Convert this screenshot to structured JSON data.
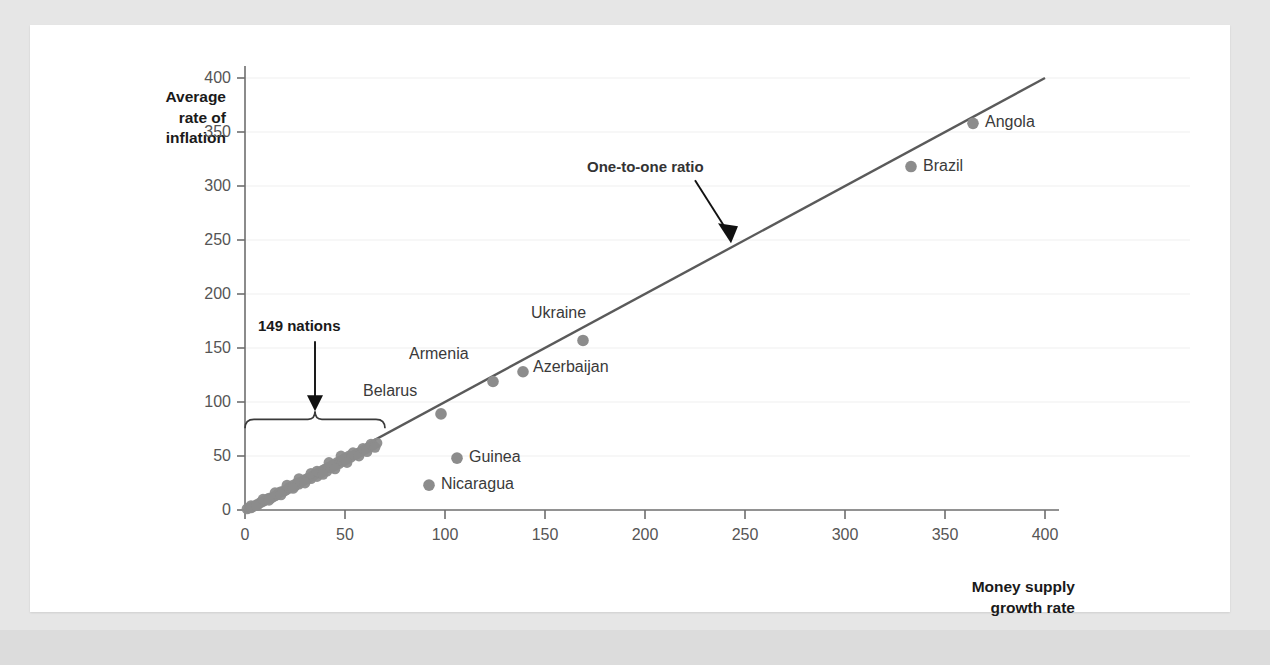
{
  "figure": {
    "background_color": "#e6e6e6",
    "card_color": "#ffffff"
  },
  "chart_data": {
    "type": "scatter",
    "title": "",
    "xlabel": "Money supply\ngrowth rate",
    "ylabel": "Average\nrate of\ninflation",
    "xlim": [
      0,
      400
    ],
    "ylim": [
      0,
      400
    ],
    "xticks": [
      0,
      50,
      100,
      150,
      200,
      250,
      300,
      350,
      400
    ],
    "yticks": [
      0,
      50,
      100,
      150,
      200,
      250,
      300,
      350,
      400
    ],
    "grid": "horizontal-light",
    "legend": "none",
    "point_color": "#8c8c8c",
    "line_color": "#5a5a5a",
    "reference_line": {
      "label": "One-to-one ratio",
      "slope": 1,
      "intercept": 0,
      "from": [
        0,
        0
      ],
      "to": [
        400,
        400
      ]
    },
    "labeled_points": [
      {
        "name": "Belarus",
        "x": 98,
        "y": 89,
        "label_dx": -78,
        "label_dy": -22
      },
      {
        "name": "Armenia",
        "x": 124,
        "y": 119,
        "label_dx": -84,
        "label_dy": -26
      },
      {
        "name": "Azerbaijan",
        "x": 139,
        "y": 128,
        "label_dx": 10,
        "label_dy": -4
      },
      {
        "name": "Ukraine",
        "x": 169,
        "y": 157,
        "label_dx": -52,
        "label_dy": -26
      },
      {
        "name": "Brazil",
        "x": 333,
        "y": 318,
        "label_dx": 12,
        "label_dy": 0
      },
      {
        "name": "Angola",
        "x": 364,
        "y": 358,
        "label_dx": 12,
        "label_dy": 0
      },
      {
        "name": "Guinea",
        "x": 106,
        "y": 48,
        "label_dx": 12,
        "label_dy": 0
      },
      {
        "name": "Nicaragua",
        "x": 92,
        "y": 23,
        "label_dx": 12,
        "label_dy": 0
      }
    ],
    "cluster_points": [
      {
        "x": 1,
        "y": 1
      },
      {
        "x": 2,
        "y": 2
      },
      {
        "x": 3,
        "y": 2
      },
      {
        "x": 4,
        "y": 3
      },
      {
        "x": 5,
        "y": 4
      },
      {
        "x": 6,
        "y": 5
      },
      {
        "x": 7,
        "y": 6
      },
      {
        "x": 8,
        "y": 7
      },
      {
        "x": 9,
        "y": 8
      },
      {
        "x": 10,
        "y": 9
      },
      {
        "x": 11,
        "y": 10
      },
      {
        "x": 12,
        "y": 11
      },
      {
        "x": 13,
        "y": 11
      },
      {
        "x": 14,
        "y": 12
      },
      {
        "x": 15,
        "y": 13
      },
      {
        "x": 16,
        "y": 14
      },
      {
        "x": 17,
        "y": 16
      },
      {
        "x": 18,
        "y": 17
      },
      {
        "x": 19,
        "y": 17
      },
      {
        "x": 20,
        "y": 18
      },
      {
        "x": 21,
        "y": 19
      },
      {
        "x": 22,
        "y": 21
      },
      {
        "x": 23,
        "y": 21
      },
      {
        "x": 24,
        "y": 23
      },
      {
        "x": 25,
        "y": 22
      },
      {
        "x": 26,
        "y": 25
      },
      {
        "x": 27,
        "y": 24
      },
      {
        "x": 28,
        "y": 26
      },
      {
        "x": 29,
        "y": 27
      },
      {
        "x": 30,
        "y": 28
      },
      {
        "x": 31,
        "y": 29
      },
      {
        "x": 32,
        "y": 30
      },
      {
        "x": 33,
        "y": 29
      },
      {
        "x": 34,
        "y": 32
      },
      {
        "x": 35,
        "y": 33
      },
      {
        "x": 36,
        "y": 31
      },
      {
        "x": 37,
        "y": 35
      },
      {
        "x": 38,
        "y": 34
      },
      {
        "x": 39,
        "y": 37
      },
      {
        "x": 40,
        "y": 38
      },
      {
        "x": 41,
        "y": 36
      },
      {
        "x": 42,
        "y": 40
      },
      {
        "x": 43,
        "y": 39
      },
      {
        "x": 44,
        "y": 42
      },
      {
        "x": 45,
        "y": 41
      },
      {
        "x": 46,
        "y": 44
      },
      {
        "x": 47,
        "y": 43
      },
      {
        "x": 48,
        "y": 46
      },
      {
        "x": 49,
        "y": 45
      },
      {
        "x": 50,
        "y": 48
      },
      {
        "x": 51,
        "y": 47
      },
      {
        "x": 52,
        "y": 50
      },
      {
        "x": 53,
        "y": 49
      },
      {
        "x": 55,
        "y": 51
      },
      {
        "x": 56,
        "y": 52
      },
      {
        "x": 58,
        "y": 54
      },
      {
        "x": 60,
        "y": 56
      },
      {
        "x": 62,
        "y": 58
      },
      {
        "x": 64,
        "y": 60
      },
      {
        "x": 66,
        "y": 62
      },
      {
        "x": 3,
        "y": 4
      },
      {
        "x": 6,
        "y": 4
      },
      {
        "x": 9,
        "y": 10
      },
      {
        "x": 12,
        "y": 9
      },
      {
        "x": 15,
        "y": 16
      },
      {
        "x": 18,
        "y": 14
      },
      {
        "x": 21,
        "y": 23
      },
      {
        "x": 24,
        "y": 20
      },
      {
        "x": 27,
        "y": 29
      },
      {
        "x": 30,
        "y": 25
      },
      {
        "x": 33,
        "y": 34
      },
      {
        "x": 36,
        "y": 36
      },
      {
        "x": 39,
        "y": 33
      },
      {
        "x": 42,
        "y": 44
      },
      {
        "x": 45,
        "y": 38
      },
      {
        "x": 48,
        "y": 50
      },
      {
        "x": 51,
        "y": 44
      },
      {
        "x": 54,
        "y": 53
      },
      {
        "x": 57,
        "y": 50
      },
      {
        "x": 59,
        "y": 57
      },
      {
        "x": 61,
        "y": 54
      },
      {
        "x": 63,
        "y": 61
      },
      {
        "x": 65,
        "y": 58
      }
    ],
    "annotations": [
      {
        "id": "nations-bracket",
        "text": "149 nations",
        "bracket_from_x": 0,
        "bracket_to_x": 70,
        "bracket_y": 84
      },
      {
        "id": "one-to-one",
        "text": "One-to-one ratio",
        "arrow_tip_x": 245,
        "arrow_tip_y": 248
      }
    ]
  },
  "ticks": {
    "x": [
      "0",
      "50",
      "100",
      "150",
      "200",
      "250",
      "300",
      "350",
      "400"
    ],
    "y": [
      "0",
      "50",
      "100",
      "150",
      "200",
      "250",
      "300",
      "350",
      "400"
    ]
  },
  "labels": {
    "y_axis_title": "Average\nrate of\ninflation",
    "x_axis_title": "Money supply\ngrowth rate",
    "one_to_one": "One-to-one ratio",
    "nations": "149 nations",
    "belarus": "Belarus",
    "armenia": "Armenia",
    "azerbaijan": "Azerbaijan",
    "ukraine": "Ukraine",
    "brazil": "Brazil",
    "angola": "Angola",
    "guinea": "Guinea",
    "nicaragua": "Nicaragua"
  }
}
